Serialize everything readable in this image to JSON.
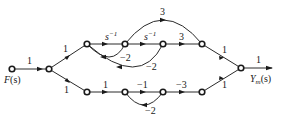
{
  "diagram": {
    "type": "signal-flow-graph",
    "input_label": "F(s)",
    "output_label": "Y_m(s)",
    "output_label_main": "Y",
    "output_label_sub": "m",
    "output_label_tail": "(s)",
    "input_label_main": "F",
    "input_label_tail": "(s)",
    "nodes": [
      {
        "id": "n0",
        "x": 12,
        "y": 69,
        "role": "input"
      },
      {
        "id": "n1",
        "x": 49,
        "y": 69
      },
      {
        "id": "u1",
        "x": 87,
        "y": 44
      },
      {
        "id": "u2",
        "x": 125,
        "y": 44
      },
      {
        "id": "u3",
        "x": 163,
        "y": 44
      },
      {
        "id": "u4",
        "x": 202,
        "y": 44
      },
      {
        "id": "l1",
        "x": 87,
        "y": 92
      },
      {
        "id": "l2",
        "x": 125,
        "y": 92
      },
      {
        "id": "l3",
        "x": 163,
        "y": 92
      },
      {
        "id": "l4",
        "x": 202,
        "y": 92
      },
      {
        "id": "n_out",
        "x": 241,
        "y": 68,
        "role": "output"
      }
    ],
    "edges": [
      {
        "from": "n0",
        "to": "n1",
        "gain": "1"
      },
      {
        "from": "n1",
        "to": "u1",
        "gain": "1"
      },
      {
        "from": "n1",
        "to": "l1",
        "gain": "1"
      },
      {
        "from": "u1",
        "to": "u2",
        "gain": "s^-1"
      },
      {
        "from": "u2",
        "to": "u3",
        "gain": "s^-1"
      },
      {
        "from": "u3",
        "to": "u4",
        "gain": "3"
      },
      {
        "from": "u2",
        "to": "u4",
        "gain": "3",
        "shape": "arc-over"
      },
      {
        "from": "u2",
        "to": "u1",
        "gain": "-2",
        "shape": "arc-under"
      },
      {
        "from": "u3",
        "to": "u1",
        "gain": "-2",
        "shape": "arc-under"
      },
      {
        "from": "u4",
        "to": "n_out",
        "gain": "1"
      },
      {
        "from": "l1",
        "to": "l2",
        "gain": "1"
      },
      {
        "from": "l2",
        "to": "l3",
        "gain": "-1"
      },
      {
        "from": "l3",
        "to": "l4",
        "gain": "-3"
      },
      {
        "from": "l3",
        "to": "l2",
        "gain": "-2",
        "shape": "arc-under"
      },
      {
        "from": "l4",
        "to": "n_out",
        "gain": "1"
      },
      {
        "from": "n_out",
        "to": "out",
        "gain": "1"
      }
    ],
    "labels": {
      "g_in": "1",
      "g_up": "1",
      "g_down": "1",
      "g_u12_base": "s",
      "g_u12_exp": "−1",
      "g_u23_base": "s",
      "g_u23_exp": "−1",
      "g_u34": "3",
      "g_arc_top": "3",
      "g_fb_inner": "−2",
      "g_fb_outer": "−2",
      "g_u_out": "1",
      "g_l12": "1",
      "g_l23": "−1",
      "g_l34": "−3",
      "g_l_fb": "−2",
      "g_l_out": "1",
      "g_out": "1"
    }
  }
}
